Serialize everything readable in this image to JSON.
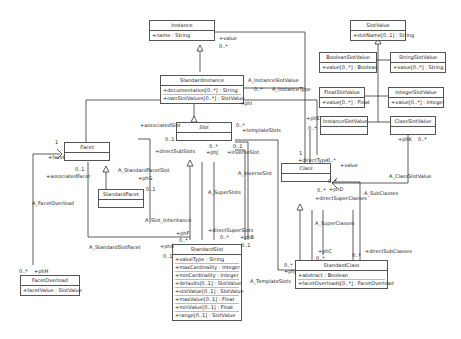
{
  "classes": {
    "instance": {
      "name": "Instance",
      "attrs": [
        "+name : String"
      ]
    },
    "standard_instance": {
      "name": "StandardInstance",
      "attrs": [
        "+documentation[0..*] : String",
        "+ownSlotValues[0..*] : SlotValue"
      ]
    },
    "slot": {
      "name": "Slot",
      "attrs": []
    },
    "facet": {
      "name": "Facet",
      "attrs": []
    },
    "standard_facet": {
      "name": "StandardFacet",
      "attrs": []
    },
    "class": {
      "name": "Class",
      "attrs": []
    },
    "standard_slot": {
      "name": "StandardSlot",
      "attrs": [
        "+valueType : String",
        "+maxCardinality : Integer",
        "+minCardinality : Integer",
        "+defaults[0..1] : SlotValue",
        "+slotValue[0..1] : SlotValue",
        "+maxValue[0..1] : Float",
        "+minValue[0..1] : Float",
        "+range[0..1] : SlotValue"
      ]
    },
    "standard_class": {
      "name": "StandardClass",
      "attrs": [
        "+abstract : Boolean",
        "+facetOverloads[0..*] : FacetOverload"
      ]
    },
    "facet_overload": {
      "name": "FacetOverload",
      "attrs": [
        "+facetValue : SlotValue"
      ]
    },
    "slot_value": {
      "name": "SlotValue",
      "attrs": [
        "+slotName[0..1] : String"
      ]
    },
    "boolean_slot_value": {
      "name": "BooleanSlotValue",
      "attrs": [
        "+value[0..*] : Boolean"
      ]
    },
    "string_slot_value": {
      "name": "StringSlotValue",
      "attrs": [
        "+value[0..*] : String"
      ]
    },
    "float_slot_value": {
      "name": "FloatSlotValue",
      "attrs": [
        "+value[0..*] : Float"
      ]
    },
    "integer_slot_value": {
      "name": "IntegerSlotValue",
      "attrs": [
        "+value[0..*] : Integer"
      ]
    },
    "instance_slot_value": {
      "name": "InstanceSlotValue",
      "attrs": []
    },
    "class_slot_value": {
      "name": "ClassSlotValue",
      "attrs": []
    }
  },
  "labels": {
    "value_top": "+value",
    "mult_0n_instance": "0..*",
    "a_instance_slot_value": "A_InstanceSlotValue",
    "mult_0n_si": "0..*",
    "a_instance_type": "A_InstanceType",
    "phi": "+phI",
    "associated_slot": "+associatedSlot",
    "mult_01_slot": "0..1",
    "template_slots": "+templateSlots",
    "mult_0n_slot": "0..*",
    "direct_sub_slots": "+directSubSlots",
    "phj": "+phJ",
    "mult_0n_phj": "0..*",
    "inverse_slot": "+inverseSlot",
    "mult_01_inv": "0..1",
    "a_inverse_slot": "A_InverseSlot",
    "a_super_slots": "A_SuperSlots",
    "a_slot_inheritance": "A_Slot_Inheritance",
    "a_standard_facet_slot": "A_StandardFacetSlot",
    "phg": "+phG",
    "mult_01_sf": "0..1",
    "mult_1_facet": "1",
    "facet_role": "+facet",
    "mult_01_facet": "0..1",
    "associated_facet": "+associatedFacet",
    "a_facet_overload": "A_FacetOverload",
    "a_standard_slot_facet": "A_StandardSlotFacet",
    "pha": "+phA",
    "mult_01_pha": "0..1",
    "phf": "+phF",
    "mult_0n_phf": "0..*",
    "direct_super_slots": "+directSuperSlots",
    "mult_0n_dss": "0..*",
    "phb": "+phB",
    "mult_01_phb": "0..1",
    "mult_0n_fo": "0..*",
    "phh": "+phH",
    "phe": "+phE",
    "mult_0n_isv": "0..*",
    "mult_1_class": "1",
    "direct_type": "+directType",
    "mult_0n_dt": "0..*",
    "value_class": "+value",
    "phk": "+phK",
    "mult_0n_csv": "0..*",
    "a_class_slot_value": "A_ClassSlotValue",
    "mult_0n_sub": "0..*",
    "mult_0n_phd": "0..*",
    "phd": "+phD",
    "direct_super_classes": "+directSuperClasses",
    "a_sub_classes": "A_SubClasses",
    "a_super_classes": "A_SuperClasses",
    "phc": "+phC",
    "mult_0n_phc": "0..*",
    "mult_0n_dsc": "0..*",
    "direct_sub_classes": "+directSubClasses",
    "mult_0n_sc": "0..*",
    "phj2": "+phJ",
    "a_template_slots": "A_TemplateSlots"
  }
}
